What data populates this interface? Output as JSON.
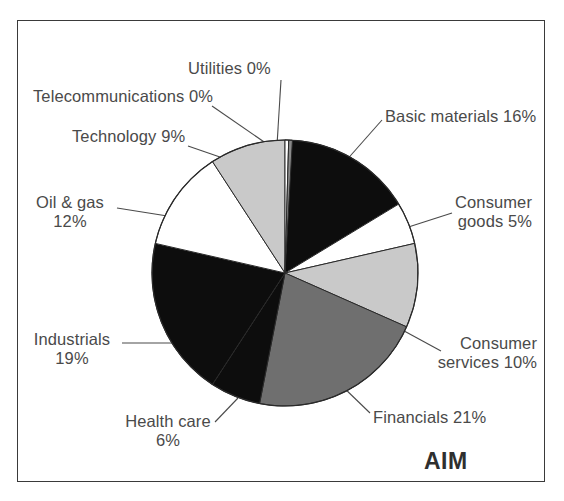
{
  "figure": {
    "source_label": "AIM",
    "frame_color": "#3a3a3a",
    "background": "#ffffff",
    "label_color": "#4a4a4a"
  },
  "chart_data": {
    "type": "pie",
    "title": "AIM",
    "xlabel": "",
    "ylabel": "",
    "start_angle_deg": 0,
    "direction": "clockwise",
    "legend_position": "callout-labels",
    "grid": false,
    "units": "percent",
    "categories": [
      "Basic materials",
      "Consumer goods",
      "Consumer services",
      "Financials",
      "Health care",
      "Industrials",
      "Oil & gas",
      "Technology",
      "Telecommunications",
      "Utilities"
    ],
    "values": [
      16,
      5,
      10,
      21,
      6,
      19,
      12,
      9,
      0,
      0
    ],
    "colors": [
      "#0d0d0d",
      "#ffffff",
      "#c9c9c9",
      "#6f6f6f",
      "#0d0d0d",
      "#0d0d0d",
      "#ffffff",
      "#c9c9c9",
      "#ffffff",
      "#8a8a8a"
    ],
    "slices": [
      {
        "label": "Basic materials",
        "value": 16,
        "display": "Basic materials 16%",
        "color": "#0d0d0d"
      },
      {
        "label": "Consumer goods",
        "value": 5,
        "display": "Consumer goods 5%",
        "color": "#ffffff"
      },
      {
        "label": "Consumer services",
        "value": 10,
        "display": "Consumer services 10%",
        "color": "#c9c9c9"
      },
      {
        "label": "Financials",
        "value": 21,
        "display": "Financials 21%",
        "color": "#6f6f6f"
      },
      {
        "label": "Health care",
        "value": 6,
        "display": "Health care 6%",
        "color": "#0d0d0d"
      },
      {
        "label": "Industrials",
        "value": 19,
        "display": "Industrials 19%",
        "color": "#0d0d0d"
      },
      {
        "label": "Oil & gas",
        "value": 12,
        "display": "Oil & gas 12%",
        "color": "#ffffff"
      },
      {
        "label": "Technology",
        "value": 9,
        "display": "Technology 9%",
        "color": "#c9c9c9"
      },
      {
        "label": "Telecommunications",
        "value": 0,
        "display": "Telecommunications 0%",
        "color": "#ffffff"
      },
      {
        "label": "Utilities",
        "value": 0,
        "display": "Utilities 0%",
        "color": "#8a8a8a"
      }
    ]
  },
  "labels": {
    "utilities": "Utilities 0%",
    "telecommunications": "Telecommunications 0%",
    "technology": "Technology 9%",
    "oil_gas_line1": "Oil & gas",
    "oil_gas_line2": "12%",
    "industrials_line1": "Industrials",
    "industrials_line2": "19%",
    "health_care_line1": "Health care",
    "health_care_line2": "6%",
    "basic_materials": "Basic materials 16%",
    "consumer_goods_line1": "Consumer",
    "consumer_goods_line2": "goods 5%",
    "consumer_services_line1": "Consumer",
    "consumer_services_line2": "services 10%",
    "financials": "Financials 21%"
  }
}
